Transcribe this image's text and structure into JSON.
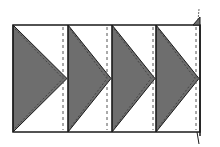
{
  "diagram": {
    "type": "quilt-strip-flying-geese",
    "units": 4,
    "direction": "pointing-right",
    "colors": {
      "background": "#ffffff",
      "triangle_fill": "#6e6e6e",
      "outline": "#1a1a1a",
      "seam_dash": "#555555"
    },
    "frame": {
      "left": 13,
      "top": 25,
      "right": 200,
      "bottom": 132
    },
    "blocks": [
      {
        "x0": 13,
        "x1": 68,
        "apex_x": 67,
        "seam_x": 63
      },
      {
        "x0": 68,
        "x1": 112,
        "apex_x": 111,
        "seam_x": 107
      },
      {
        "x0": 112,
        "x1": 156,
        "apex_x": 155,
        "seam_x": 153
      },
      {
        "x0": 156,
        "x1": 200,
        "apex_x": 199,
        "seam_x": 196
      }
    ],
    "edge_marks": {
      "top_right_tab": true,
      "bottom_right_tail": true
    }
  }
}
